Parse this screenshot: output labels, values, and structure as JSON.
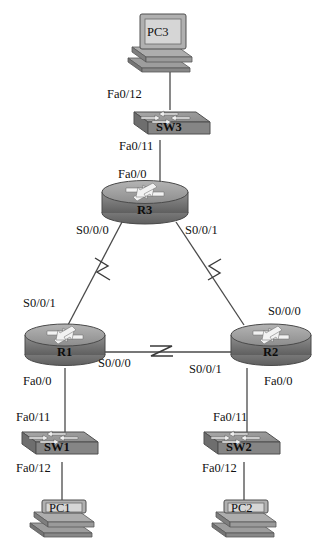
{
  "diagram": {
    "type": "network-topology",
    "background": "#ffffff",
    "device_fill": "#9a9a9a",
    "device_shade": "#6f6f6f",
    "device_light": "#c2c2c2",
    "line_color": "#4a4a4a",
    "text_color": "#111111"
  },
  "devices": {
    "pc3": {
      "name": "PC3",
      "type": "pc"
    },
    "sw3": {
      "name": "SW3",
      "type": "switch"
    },
    "r3": {
      "name": "R3",
      "type": "router"
    },
    "r1": {
      "name": "R1",
      "type": "router"
    },
    "r2": {
      "name": "R2",
      "type": "router"
    },
    "sw1": {
      "name": "SW1",
      "type": "switch"
    },
    "sw2": {
      "name": "SW2",
      "type": "switch"
    },
    "pc1": {
      "name": "PC1",
      "type": "pc"
    },
    "pc2": {
      "name": "PC2",
      "type": "pc"
    }
  },
  "interface_labels": {
    "sw3_to_pc3": "Fa0/12",
    "sw3_to_r3": "Fa0/11",
    "r3_to_sw3": "Fa0/0",
    "r3_to_r1": "S0/0/0",
    "r3_to_r2": "S0/0/1",
    "r1_to_r3": "S0/0/1",
    "r1_to_r2": "S0/0/0",
    "r1_to_sw1": "Fa0/0",
    "r2_to_r3": "S0/0/0",
    "r2_to_r1": "S0/0/1",
    "r2_to_sw2": "Fa0/0",
    "sw1_to_r1": "Fa0/11",
    "sw1_to_pc1": "Fa0/12",
    "sw2_to_r2": "Fa0/11",
    "sw2_to_pc2": "Fa0/12"
  },
  "links": [
    {
      "from": "PC3",
      "to": "SW3",
      "media": "ethernet"
    },
    {
      "from": "SW3",
      "to": "R3",
      "media": "ethernet"
    },
    {
      "from": "R3",
      "to": "R1",
      "media": "serial"
    },
    {
      "from": "R3",
      "to": "R2",
      "media": "serial"
    },
    {
      "from": "R1",
      "to": "R2",
      "media": "serial"
    },
    {
      "from": "R1",
      "to": "SW1",
      "media": "ethernet"
    },
    {
      "from": "R2",
      "to": "SW2",
      "media": "ethernet"
    },
    {
      "from": "SW1",
      "to": "PC1",
      "media": "ethernet"
    },
    {
      "from": "SW2",
      "to": "PC2",
      "media": "ethernet"
    }
  ]
}
